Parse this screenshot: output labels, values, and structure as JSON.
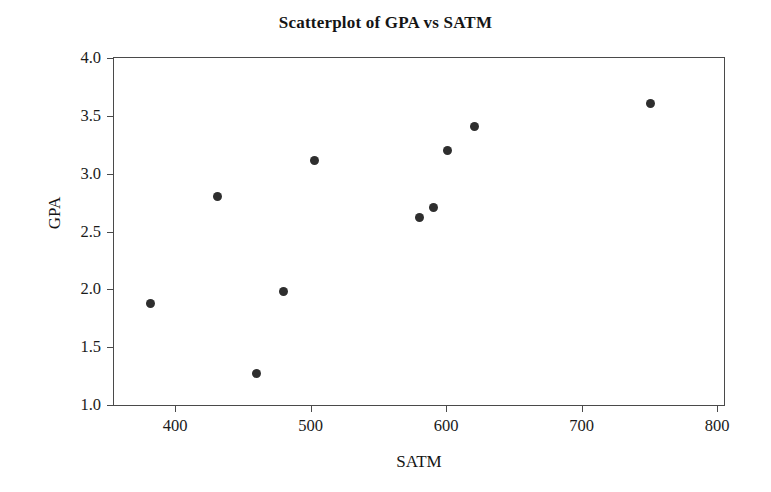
{
  "chart_data": {
    "type": "scatter",
    "title": "Scatterplot of GPA vs SATM",
    "xlabel": "SATM",
    "ylabel": "GPA",
    "xlim": [
      355,
      805
    ],
    "ylim": [
      1.0,
      4.0
    ],
    "xticks": [
      400,
      500,
      600,
      700,
      800
    ],
    "yticks": [
      "4.0",
      "3.5",
      "3.0",
      "2.5",
      "2.0",
      "1.5",
      "1.0"
    ],
    "ytick_values": [
      4.0,
      3.5,
      3.0,
      2.5,
      2.0,
      1.5,
      1.0
    ],
    "grid": false,
    "legend": null,
    "series": [
      {
        "name": "students",
        "marker": "filled-circle",
        "color": "#2e2e2e",
        "x": [
          382,
          431,
          460,
          480,
          503,
          580,
          591,
          601,
          621,
          751
        ],
        "y": [
          1.88,
          2.8,
          1.27,
          1.98,
          3.11,
          2.62,
          2.71,
          3.2,
          3.41,
          3.61
        ],
        "points": [
          {
            "x": 382,
            "y": 1.88
          },
          {
            "x": 431,
            "y": 2.8
          },
          {
            "x": 460,
            "y": 1.27
          },
          {
            "x": 480,
            "y": 1.98
          },
          {
            "x": 503,
            "y": 3.11
          },
          {
            "x": 580,
            "y": 2.62
          },
          {
            "x": 591,
            "y": 2.71
          },
          {
            "x": 601,
            "y": 3.2
          },
          {
            "x": 621,
            "y": 3.41
          },
          {
            "x": 751,
            "y": 3.61
          }
        ]
      }
    ]
  },
  "colors": {
    "marker": "#2e2e2e",
    "axis": "#4a4a4a",
    "text": "#1a1a1a",
    "background": "#ffffff"
  }
}
